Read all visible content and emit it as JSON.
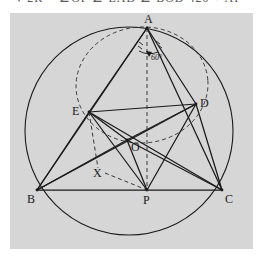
{
  "page": {
    "top_partial_text": "= √ 2R  ≡ ∠OF  ∠ EAD     ∠ BOD    420 + AP",
    "background_color": "#ffffff",
    "panel_color": "#d6d6d6"
  },
  "figure": {
    "stroke_color": "#1a1a1a",
    "dash_color": "#3a3a3a",
    "labels": [
      {
        "id": "A",
        "text": "A",
        "x": 146,
        "y": 19,
        "anchor": "vertex-top"
      },
      {
        "id": "D",
        "text": "D",
        "x": 202,
        "y": 101,
        "anchor": "vertex-right"
      },
      {
        "id": "E",
        "text": "E",
        "x": 74,
        "y": 109,
        "anchor": "vertex-left"
      },
      {
        "id": "O",
        "text": "O",
        "x": 131,
        "y": 146,
        "anchor": "interior"
      },
      {
        "id": "X",
        "text": "X",
        "x": 94,
        "y": 171,
        "anchor": "interior"
      },
      {
        "id": "B",
        "text": "B",
        "x": 28,
        "y": 200,
        "anchor": "vertex-bottom-left"
      },
      {
        "id": "P",
        "text": "P",
        "x": 143,
        "y": 200,
        "anchor": "vertex-bottom"
      },
      {
        "id": "C",
        "text": "C",
        "x": 225,
        "y": 200,
        "anchor": "vertex-bottom-right"
      },
      {
        "id": "angle60",
        "text": "60°",
        "x": 150,
        "y": 55,
        "anchor": "angle-at-A"
      }
    ],
    "points": {
      "A": {
        "x": 147,
        "y": 28
      },
      "B": {
        "x": 37,
        "y": 190
      },
      "C": {
        "x": 222,
        "y": 190
      },
      "D": {
        "x": 196,
        "y": 104
      },
      "E": {
        "x": 89,
        "y": 112
      },
      "O": {
        "x": 127,
        "y": 140
      },
      "P": {
        "x": 147,
        "y": 190
      },
      "X": {
        "x": 103,
        "y": 166
      }
    },
    "circumcircle": {
      "cx": 129,
      "cy": 131,
      "r": 104
    },
    "innercircle": {
      "cx": 142,
      "cy": 85,
      "rx": 66,
      "ry": 58,
      "rotate": -4,
      "style": "dashed"
    },
    "solid_segments": [
      "A-B",
      "A-C",
      "B-C",
      "A-E",
      "A-D",
      "E-D",
      "E-B",
      "D-C",
      "E-O",
      "O-D",
      "E-P",
      "D-P",
      "E-C",
      "D-B",
      "O-P",
      "O-C",
      "O-B"
    ],
    "dashed_segments": [
      "A-O-P",
      "E-X",
      "X-P",
      "E-arcs",
      "O-D-dash",
      "E-O-dash"
    ],
    "angle_marks": {
      "vertex": "A",
      "value": "60°",
      "ticks": 2
    }
  }
}
